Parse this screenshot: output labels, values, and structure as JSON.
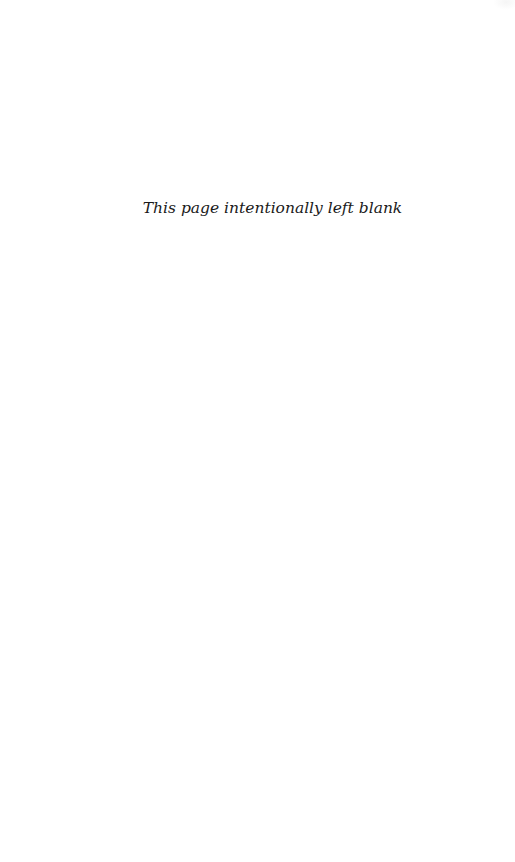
{
  "page": {
    "notice_text": "This page intentionally left blank"
  }
}
